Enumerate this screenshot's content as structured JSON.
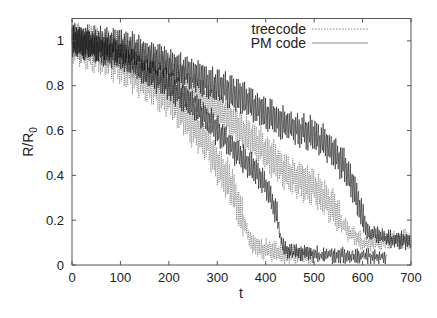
{
  "chart_data": {
    "type": "line",
    "title": "",
    "xlabel": "t",
    "ylabel": "R/R0",
    "ylabel_main": "R/R",
    "ylabel_sub": "0",
    "xlim": [
      0,
      700
    ],
    "ylim": [
      0,
      1.1
    ],
    "grid": false,
    "legend_position": "top-right",
    "x_ticks": [
      0,
      100,
      200,
      300,
      400,
      500,
      600,
      700
    ],
    "x_tick_labels": [
      "0",
      "100",
      "200",
      "300",
      "400",
      "500",
      "600",
      "700"
    ],
    "y_ticks": [
      0,
      0.2,
      0.4,
      0.6,
      0.8,
      1
    ],
    "y_tick_labels": [
      "0",
      "0.2",
      "0.4",
      "0.6",
      "0.8",
      "1"
    ],
    "legend": [
      {
        "label": "treecode",
        "style": "dotted"
      },
      {
        "label": "PM code",
        "style": "solid"
      }
    ],
    "series": [
      {
        "name": "treecode",
        "style": "dotted",
        "run": "early-collapse",
        "x": [
          0,
          50,
          100,
          150,
          200,
          250,
          280,
          300,
          330,
          350,
          370,
          400,
          450,
          500
        ],
        "values": [
          1.0,
          0.95,
          0.9,
          0.83,
          0.75,
          0.62,
          0.55,
          0.45,
          0.35,
          0.22,
          0.1,
          0.07,
          0.05,
          0.04
        ],
        "amplitude": 0.09
      },
      {
        "name": "PM code",
        "style": "solid",
        "run": "early-collapse",
        "x": [
          0,
          50,
          100,
          150,
          200,
          250,
          300,
          340,
          380,
          400,
          420,
          435,
          450,
          500,
          550,
          600,
          650
        ],
        "values": [
          1.0,
          0.97,
          0.93,
          0.87,
          0.8,
          0.72,
          0.6,
          0.5,
          0.42,
          0.35,
          0.25,
          0.08,
          0.06,
          0.05,
          0.04,
          0.04,
          0.03
        ],
        "amplitude": 0.06
      },
      {
        "name": "treecode",
        "style": "dotted",
        "run": "late-collapse",
        "x": [
          0,
          50,
          100,
          150,
          200,
          250,
          300,
          350,
          380,
          420,
          450,
          500,
          540,
          570,
          600,
          650,
          700
        ],
        "values": [
          1.0,
          0.98,
          0.95,
          0.9,
          0.85,
          0.78,
          0.7,
          0.6,
          0.55,
          0.46,
          0.4,
          0.35,
          0.25,
          0.15,
          0.1,
          0.11,
          0.12
        ],
        "amplitude": 0.08
      },
      {
        "name": "PM code",
        "style": "solid",
        "run": "late-collapse",
        "x": [
          0,
          50,
          100,
          150,
          200,
          250,
          300,
          350,
          380,
          420,
          450,
          500,
          520,
          560,
          580,
          600,
          610,
          650,
          700
        ],
        "values": [
          1.0,
          0.99,
          0.98,
          0.94,
          0.9,
          0.85,
          0.8,
          0.75,
          0.7,
          0.65,
          0.62,
          0.58,
          0.55,
          0.45,
          0.35,
          0.22,
          0.15,
          0.12,
          0.1
        ],
        "amplitude": 0.07
      }
    ]
  }
}
